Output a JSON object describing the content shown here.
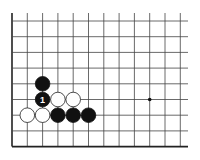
{
  "diagram": {
    "type": "go-board-partial",
    "view": "lower-left corner",
    "grid": {
      "origin_x": 12,
      "origin_y": 21,
      "spacing_x": 15.3,
      "spacing_y": 15.7,
      "columns": 12,
      "rows": 9,
      "top_extend_y": 13,
      "right_extend_x": 188,
      "line_color": "#444444",
      "edge_color": "#222222"
    },
    "star_points": [
      {
        "col": 9,
        "row": 5
      }
    ],
    "stones": [
      {
        "color": "black",
        "col": 2,
        "row": 4,
        "label": ""
      },
      {
        "color": "black",
        "col": 2,
        "row": 5,
        "label": "1"
      },
      {
        "color": "white",
        "col": 3,
        "row": 5,
        "label": ""
      },
      {
        "color": "white",
        "col": 4,
        "row": 5,
        "label": ""
      },
      {
        "color": "white",
        "col": 1,
        "row": 6,
        "label": ""
      },
      {
        "color": "white",
        "col": 2,
        "row": 6,
        "label": ""
      },
      {
        "color": "black",
        "col": 3,
        "row": 6,
        "label": ""
      },
      {
        "color": "black",
        "col": 4,
        "row": 6,
        "label": ""
      },
      {
        "color": "black",
        "col": 5,
        "row": 6,
        "label": ""
      }
    ],
    "colors": {
      "black_stone": "#111111",
      "white_stone": "#ffffff",
      "white_outline": "#222222",
      "label_on_black": "#ffffff"
    }
  }
}
